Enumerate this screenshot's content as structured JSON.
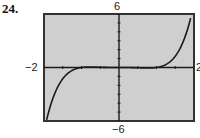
{
  "problem_number": "24.",
  "chart_data": {
    "type": "line",
    "title": "",
    "xlabel": "",
    "ylabel": "",
    "xlim": [
      -2,
      2
    ],
    "ylim": [
      -6,
      6
    ],
    "window_labels": {
      "xmin": "−2",
      "xmax": "2",
      "ymin": "−6",
      "ymax": "6"
    },
    "grid": false,
    "x_tick_step": 0.5,
    "y_tick_step": 1,
    "series": [
      {
        "name": "f(x)",
        "description": "odd polynomial, nearly flat near zero on [-1,1], rising steeply outside",
        "approx_formula": "0.3*(x^5 - x^3)",
        "x": [
          -1.95,
          -1.8,
          -1.6,
          -1.4,
          -1.2,
          -1.0,
          -0.8,
          -0.6,
          -0.4,
          -0.2,
          0,
          0.2,
          0.4,
          0.6,
          0.8,
          1.0,
          1.2,
          1.4,
          1.6,
          1.8,
          1.9
        ],
        "y": [
          -6.19,
          -3.92,
          -1.91,
          -0.79,
          -0.23,
          0,
          0.06,
          0.04,
          0.02,
          0.0,
          0,
          0.0,
          -0.02,
          -0.04,
          -0.06,
          0,
          0.23,
          0.79,
          1.91,
          3.92,
          5.37
        ]
      }
    ],
    "colors": {
      "plot_background": "#cfcfcf",
      "curve": "#1a1a1a",
      "axes": "#1a1a1a",
      "frame": "#333333"
    }
  }
}
